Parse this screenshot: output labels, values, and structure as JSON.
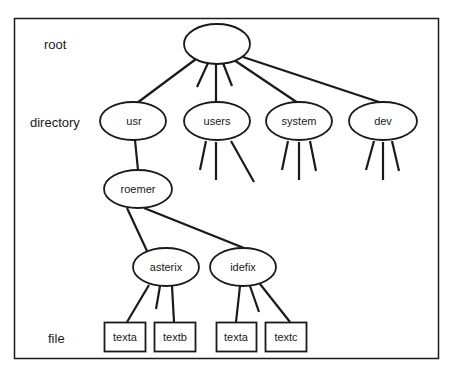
{
  "levels": {
    "root": "root",
    "directory": "directory",
    "file": "file"
  },
  "nodes": {
    "root": "",
    "usr": "usr",
    "users": "users",
    "system": "system",
    "dev": "dev",
    "roemer": "roemer",
    "asterix": "asterix",
    "idefix": "idefix"
  },
  "files": {
    "asterix_texta": "texta",
    "asterix_textb": "textb",
    "idefix_texta": "texta",
    "idefix_textc": "textc"
  },
  "colors": {
    "stroke": "#1a1a1a",
    "background": "#ffffff"
  }
}
